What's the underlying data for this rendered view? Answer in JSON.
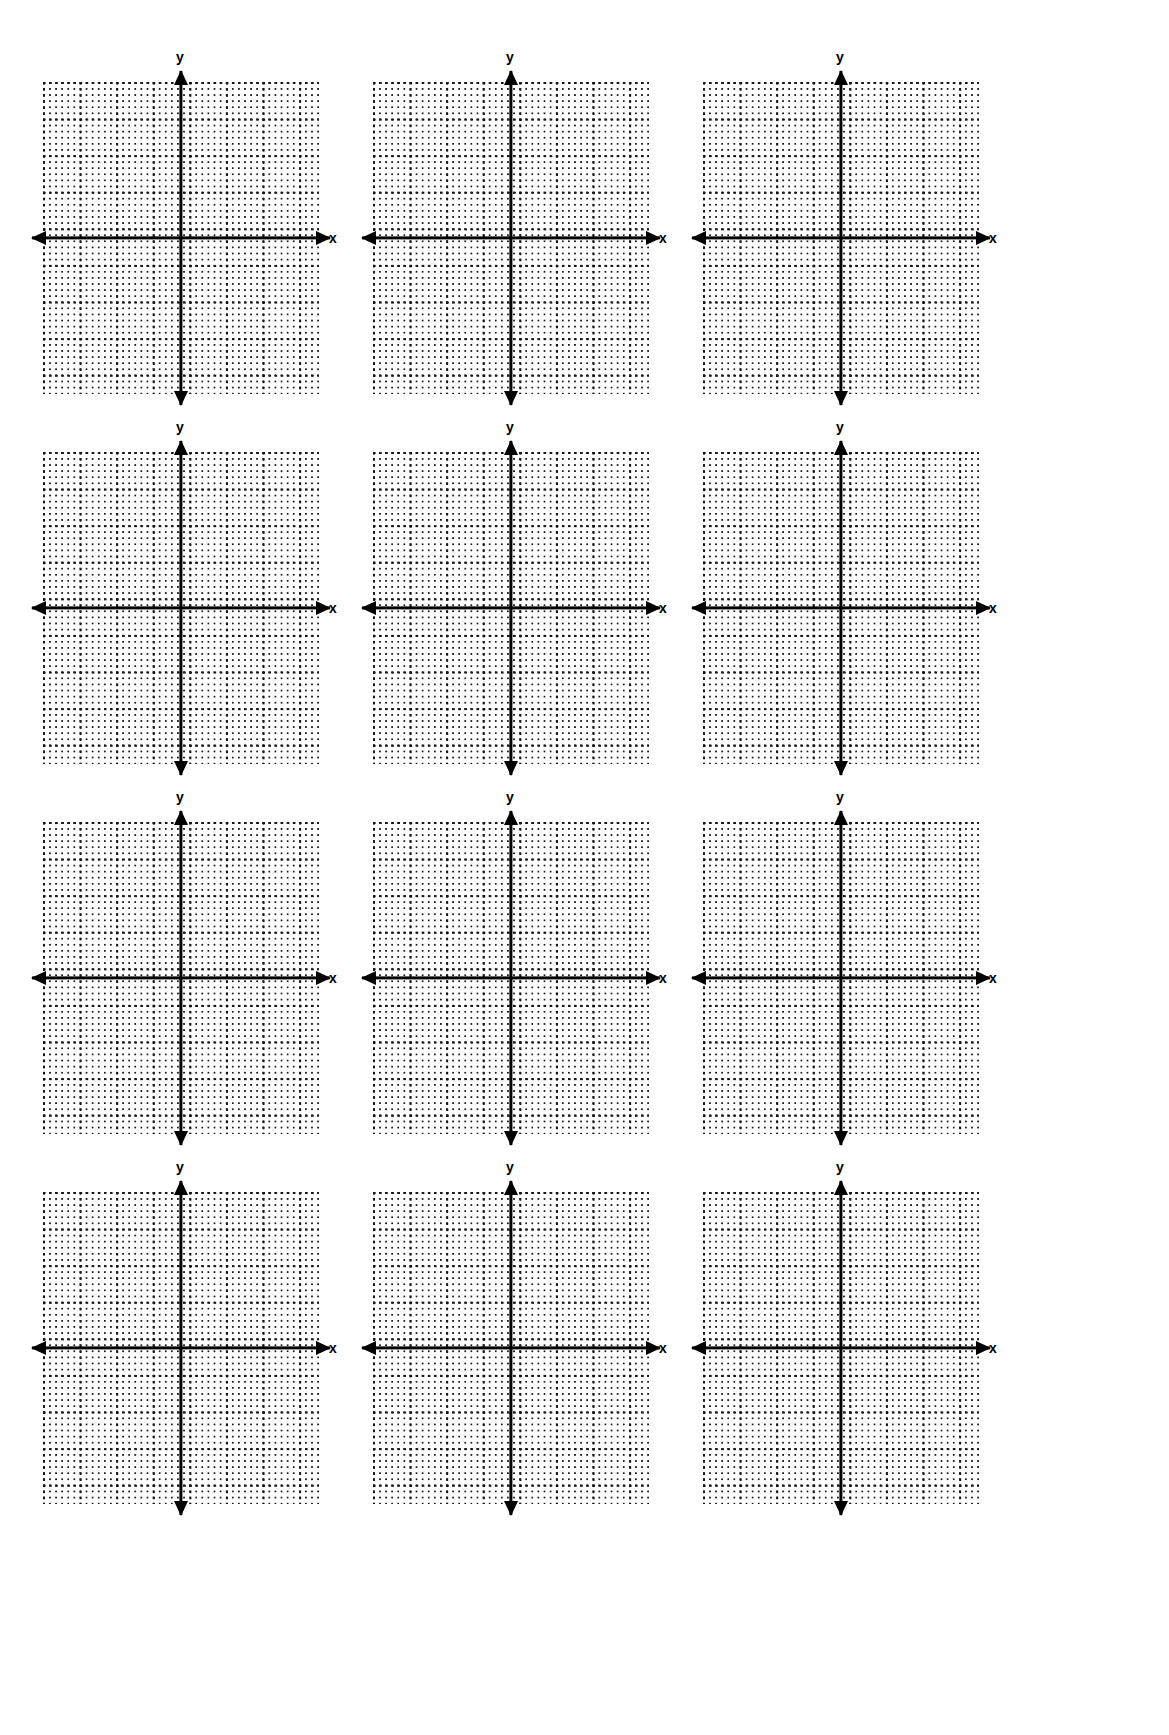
{
  "document": {
    "kind": "blank-coordinate-plane-worksheet",
    "background_color": "#ffffff",
    "ink_color": "#000000",
    "rows": 4,
    "columns": 3,
    "total_graphs": 12
  },
  "graph_template": {
    "x_axis_label": "x",
    "y_axis_label": "y",
    "grid_style": "dotted",
    "arrowheads": [
      "left",
      "right",
      "up",
      "down"
    ]
  },
  "graphs": [
    {
      "id": "graph-1",
      "row": 1,
      "column": 1,
      "x_label": "x",
      "y_label": "y"
    },
    {
      "id": "graph-2",
      "row": 1,
      "column": 2,
      "x_label": "x",
      "y_label": "y"
    },
    {
      "id": "graph-3",
      "row": 1,
      "column": 3,
      "x_label": "x",
      "y_label": "y"
    },
    {
      "id": "graph-4",
      "row": 2,
      "column": 1,
      "x_label": "x",
      "y_label": "y"
    },
    {
      "id": "graph-5",
      "row": 2,
      "column": 2,
      "x_label": "x",
      "y_label": "y"
    },
    {
      "id": "graph-6",
      "row": 2,
      "column": 3,
      "x_label": "x",
      "y_label": "y"
    },
    {
      "id": "graph-7",
      "row": 3,
      "column": 1,
      "x_label": "x",
      "y_label": "y"
    },
    {
      "id": "graph-8",
      "row": 3,
      "column": 2,
      "x_label": "x",
      "y_label": "y"
    },
    {
      "id": "graph-9",
      "row": 3,
      "column": 3,
      "x_label": "x",
      "y_label": "y"
    },
    {
      "id": "graph-10",
      "row": 4,
      "column": 1,
      "x_label": "x",
      "y_label": "y"
    },
    {
      "id": "graph-11",
      "row": 4,
      "column": 2,
      "x_label": "x",
      "y_label": "y"
    },
    {
      "id": "graph-12",
      "row": 4,
      "column": 3,
      "x_label": "x",
      "y_label": "y"
    }
  ],
  "chart_data": {
    "type": "scatter",
    "title": "",
    "subtitle": "",
    "xlabel": "x",
    "ylabel": "y",
    "xlim": [
      -7,
      7
    ],
    "ylim": [
      -7,
      8
    ],
    "grid": true,
    "legend": false,
    "series": [],
    "x": [],
    "values": [],
    "note": "Twelve empty (unplotted) Cartesian coordinate planes on dotted graph paper; no data points, tick numbers, or curves are drawn."
  },
  "layout": {
    "row_tops": [
      60,
      430,
      800,
      1170
    ],
    "column_lefts": [
      28,
      358,
      688
    ],
    "graph_width": 340,
    "graph_height": 380,
    "plane_width": 276,
    "plane_height": 312,
    "minor_dot_spacing_px": 6.1,
    "major_line_spacing_px": 36.6
  }
}
